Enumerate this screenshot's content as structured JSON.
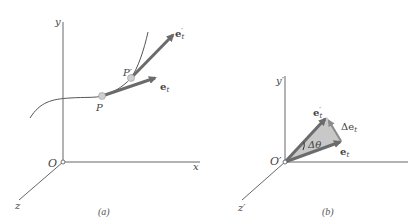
{
  "panel_a": {
    "caption": "(a)",
    "axes": {
      "y_label": "y",
      "x_label": "x",
      "z_label": "z",
      "origin_label": "O"
    },
    "points": {
      "P": "P",
      "P_prime": "P′"
    },
    "vectors": {
      "e_t": "e",
      "e_t_sub": "t",
      "e_t_prime": "e",
      "e_t_prime_sub": "t",
      "e_t_prime_mark": "′"
    }
  },
  "panel_b": {
    "caption": "(b)",
    "axes": {
      "y_label": "y′",
      "z_label": "z′",
      "origin_label": "O′"
    },
    "vectors": {
      "e_t": "e",
      "e_t_sub": "t",
      "e_t_prime": "e",
      "e_t_prime_sub": "t",
      "e_t_prime_mark": "′",
      "delta_e": "Δe",
      "delta_e_sub": "t"
    },
    "angle_label": "Δθ"
  },
  "colors": {
    "axis": "#555555",
    "vector": "#6b6b6b",
    "triangle_fill": "#c8c8c8",
    "point_fill": "#cfcfcf",
    "curve": "#555555"
  }
}
